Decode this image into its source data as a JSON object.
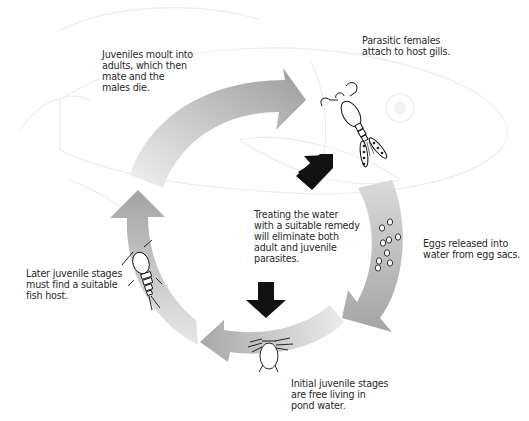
{
  "diagram": {
    "stages": [
      {
        "id": "adults",
        "text": "Juveniles moult into\nadults, which then\nmate and the\nmales die."
      },
      {
        "id": "attach",
        "text": "Parasitic females\nattach to host gills."
      },
      {
        "id": "eggs",
        "text": "Eggs released into\nwater from egg sacs."
      },
      {
        "id": "initial",
        "text": "Initial juvenile stages\nare free living in\npond water."
      },
      {
        "id": "later",
        "text": "Later juvenile stages\nmust find a suitable\nfish host."
      }
    ],
    "treatment_note": "Treating the water\nwith a suitable remedy\nwill eliminate both\nadult and juvenile\nparasites.",
    "icons": [
      "adult-female-copepod-icon",
      "eggs-icon",
      "nauplius-larva-icon",
      "copepodid-juvenile-icon",
      "fish-outline-background",
      "treatment-arrow-icon"
    ],
    "colors": {
      "arrow_light": "#eeeeee",
      "arrow_dark": "#a9a9a9",
      "treatment_arrow": "#111111",
      "fish_outline": "#ececec",
      "text": "#2a2a2a"
    }
  }
}
